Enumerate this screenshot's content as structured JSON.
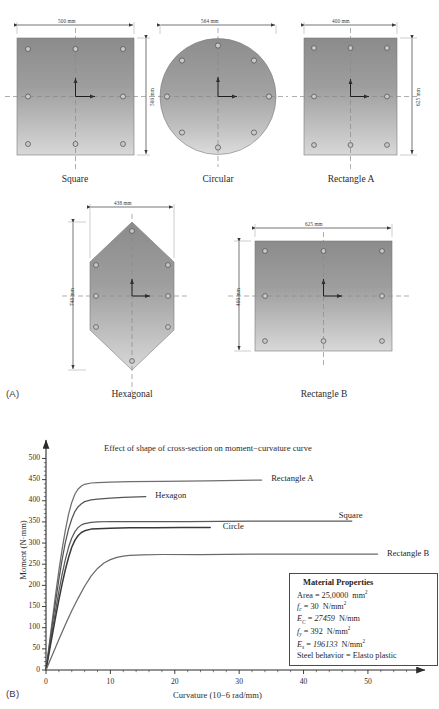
{
  "panel_a": {
    "tag": "(A)",
    "sections": [
      {
        "name": "square",
        "caption": "Square",
        "width_label": "500 mm",
        "height_label": "500 mm",
        "rebar_count": 8
      },
      {
        "name": "circular",
        "caption": "Circular",
        "width_label": "564 mm",
        "height_label": "",
        "rebar_count": 8
      },
      {
        "name": "rectangle-a",
        "caption": "Rectangle A",
        "width_label": "400 mm",
        "height_label": "625 mm",
        "rebar_count": 8
      },
      {
        "name": "hexagonal",
        "caption": "Hexagonal",
        "width_label": "438 mm",
        "height_label": "748 mm",
        "rebar_count": 8
      },
      {
        "name": "rectangle-b",
        "caption": "Rectangle B",
        "width_label": "625 mm",
        "height_label": "400 mm",
        "rebar_count": 8
      }
    ]
  },
  "panel_b": {
    "tag": "(B)",
    "material_properties": {
      "heading": "Material Properties",
      "rows": [
        {
          "sym": "Area",
          "sub": "",
          "eq": "=",
          "val": "25,0000",
          "unit": "mm",
          "unit_sup": "2",
          "italic": false
        },
        {
          "sym": "f",
          "sub": "c",
          "eq": "=",
          "val": "30",
          "unit": "N/mm",
          "unit_sup": "2",
          "italic": true
        },
        {
          "sym": "E",
          "sub": "C",
          "eq": "=",
          "val": "27459",
          "unit": "N/mm",
          "unit_sup": "",
          "italic": true
        },
        {
          "sym": "f",
          "sub": "y",
          "eq": "=",
          "val": "392",
          "unit": "N/mm",
          "unit_sup": "2",
          "italic": true
        },
        {
          "sym": "E",
          "sub": "s",
          "eq": "=",
          "val": "196133",
          "unit": "N/mm",
          "unit_sup": "2",
          "italic": true
        }
      ],
      "steel_behavior": "Steel behavior = Elasto  plastic"
    },
    "chart_data": {
      "type": "line",
      "title": "Effect of shape of cross-section on moment−curvature curve",
      "xlabel": "Curvature (10−6 rad/mm)",
      "ylabel": "Moment (N·mm)",
      "xlim": [
        0,
        57
      ],
      "ylim": [
        0,
        520
      ],
      "xticks": [
        0,
        10,
        20,
        30,
        40,
        50
      ],
      "yticks": [
        0,
        50,
        100,
        150,
        200,
        250,
        300,
        350,
        400,
        450,
        500
      ],
      "xminor_step": 2,
      "yminor_step": 10,
      "grid": false,
      "legend_position": "inline-right-of-curve",
      "series": [
        {
          "name": "Rectangle A",
          "color": "#6e6e6e",
          "label_x": 34.5,
          "label_y": 450,
          "points": [
            [
              0,
              0
            ],
            [
              0.5,
              60
            ],
            [
              1,
              120
            ],
            [
              1.5,
              180
            ],
            [
              2,
              235
            ],
            [
              2.5,
              285
            ],
            [
              3,
              330
            ],
            [
              3.5,
              368
            ],
            [
              4,
              396
            ],
            [
              4.5,
              416
            ],
            [
              5,
              428
            ],
            [
              5.5,
              435
            ],
            [
              6,
              439
            ],
            [
              7,
              442
            ],
            [
              8,
              443
            ],
            [
              10,
              444
            ],
            [
              13,
              445
            ],
            [
              18,
              446
            ],
            [
              25,
              447
            ],
            [
              33.5,
              449
            ]
          ]
        },
        {
          "name": "Hexagon",
          "color": "#555555",
          "label_x": 16.5,
          "label_y": 410,
          "points": [
            [
              0,
              0
            ],
            [
              0.5,
              55
            ],
            [
              1,
              110
            ],
            [
              1.5,
              163
            ],
            [
              2,
              214
            ],
            [
              2.5,
              261
            ],
            [
              3,
              301
            ],
            [
              3.5,
              333
            ],
            [
              4,
              357
            ],
            [
              4.5,
              375
            ],
            [
              5,
              386
            ],
            [
              5.5,
              393
            ],
            [
              6,
              398
            ],
            [
              7,
              402
            ],
            [
              8,
              404
            ],
            [
              10,
              406
            ],
            [
              12,
              408
            ],
            [
              15.5,
              410
            ]
          ]
        },
        {
          "name": "Square",
          "color": "#5a5a5a",
          "label_x": 45.0,
          "label_y": 362,
          "points": [
            [
              0,
              0
            ],
            [
              0.5,
              48
            ],
            [
              1,
              96
            ],
            [
              1.5,
              142
            ],
            [
              2,
              186
            ],
            [
              2.5,
              226
            ],
            [
              3,
              261
            ],
            [
              3.5,
              290
            ],
            [
              4,
              312
            ],
            [
              4.5,
              327
            ],
            [
              5,
              337
            ],
            [
              5.5,
              343
            ],
            [
              6,
              346
            ],
            [
              7,
              349
            ],
            [
              8,
              350
            ],
            [
              10,
              351
            ],
            [
              15,
              351
            ],
            [
              22,
              351
            ],
            [
              32,
              352
            ],
            [
              41,
              352
            ],
            [
              47.5,
              352
            ]
          ]
        },
        {
          "name": "Circle",
          "color": "#3a3a3a",
          "label_x": 27.0,
          "label_y": 338,
          "points": [
            [
              0,
              0
            ],
            [
              0.5,
              42
            ],
            [
              1,
              84
            ],
            [
              1.5,
              126
            ],
            [
              2,
              166
            ],
            [
              2.5,
              203
            ],
            [
              3,
              237
            ],
            [
              3.5,
              266
            ],
            [
              4,
              290
            ],
            [
              4.5,
              307
            ],
            [
              5,
              318
            ],
            [
              5.5,
              325
            ],
            [
              6,
              329
            ],
            [
              7,
              333
            ],
            [
              8,
              334
            ],
            [
              10,
              335
            ],
            [
              13,
              336
            ],
            [
              17,
              336
            ],
            [
              21,
              337
            ],
            [
              25.5,
              337
            ]
          ]
        },
        {
          "name": "Rectangle B",
          "color": "#6a6a6a",
          "label_x": 52.5,
          "label_y": 274,
          "points": [
            [
              0,
              0
            ],
            [
              1,
              36
            ],
            [
              2,
              72
            ],
            [
              3,
              107
            ],
            [
              4,
              140
            ],
            [
              5,
              170
            ],
            [
              6,
              198
            ],
            [
              7,
              222
            ],
            [
              8,
              240
            ],
            [
              9,
              253
            ],
            [
              10,
              261
            ],
            [
              11,
              266
            ],
            [
              12,
              269
            ],
            [
              13,
              271
            ],
            [
              15,
              272
            ],
            [
              18,
              273
            ],
            [
              24,
              273
            ],
            [
              32,
              274
            ],
            [
              42,
              274
            ],
            [
              51.5,
              274
            ]
          ]
        }
      ]
    }
  }
}
